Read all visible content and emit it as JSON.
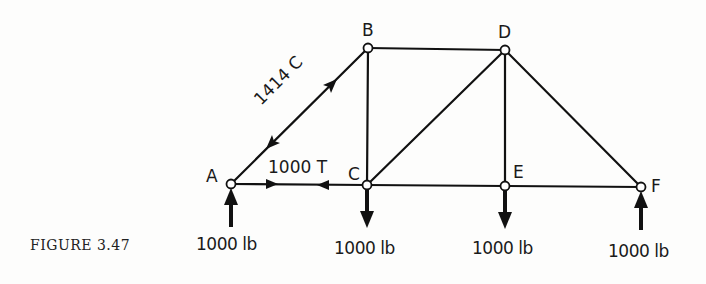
{
  "figure": {
    "caption": "FIGURE 3.47",
    "nodes": [
      {
        "id": "A",
        "label": "A"
      },
      {
        "id": "B",
        "label": "B"
      },
      {
        "id": "C",
        "label": "C"
      },
      {
        "id": "D",
        "label": "D"
      },
      {
        "id": "E",
        "label": "E"
      },
      {
        "id": "F",
        "label": "F"
      }
    ],
    "members": [
      {
        "from": "A",
        "to": "B",
        "label": "1414 C"
      },
      {
        "from": "A",
        "to": "C",
        "label": "1000 T"
      },
      {
        "from": "B",
        "to": "C",
        "label": ""
      },
      {
        "from": "B",
        "to": "D",
        "label": ""
      },
      {
        "from": "C",
        "to": "D",
        "label": ""
      },
      {
        "from": "C",
        "to": "E",
        "label": ""
      },
      {
        "from": "D",
        "to": "E",
        "label": ""
      },
      {
        "from": "D",
        "to": "F",
        "label": ""
      },
      {
        "from": "E",
        "to": "F",
        "label": ""
      }
    ],
    "loads": [
      {
        "node": "A",
        "direction": "up",
        "label": "1000 lb"
      },
      {
        "node": "C",
        "direction": "down",
        "label": "1000 lb"
      },
      {
        "node": "E",
        "direction": "down",
        "label": "1000 lb"
      },
      {
        "node": "F",
        "direction": "up",
        "label": "1000 lb"
      }
    ]
  }
}
